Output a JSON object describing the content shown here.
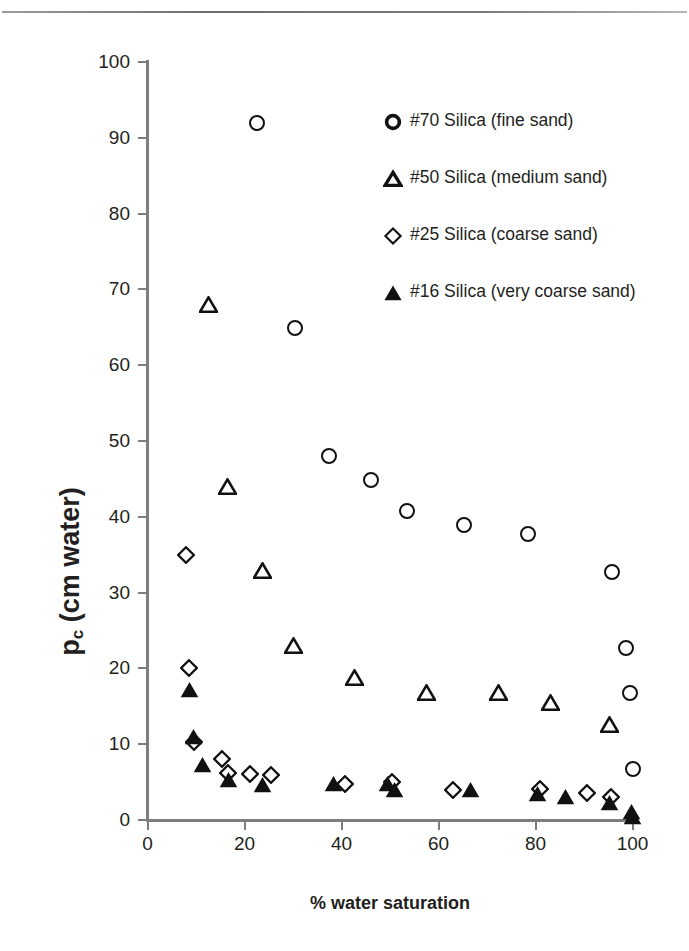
{
  "figure": {
    "x_axis_title": "% water saturation",
    "y_axis_title_main": "p",
    "y_axis_title_sub": "c",
    "y_axis_title_rest": " (cm water)"
  },
  "legend": {
    "items": [
      {
        "label": "#70 Silica  (fine sand)",
        "marker": "circle-open",
        "series": "#70"
      },
      {
        "label": "#50 Silica  (medium sand)",
        "marker": "triangle-open",
        "series": "#50"
      },
      {
        "label": "#25 Silica  (coarse sand)",
        "marker": "diamond-open",
        "series": "#25"
      },
      {
        "label": "#16 Silica  (very coarse sand)",
        "marker": "triangle-filled",
        "series": "#16"
      }
    ]
  },
  "chart_data": {
    "type": "scatter",
    "title": "",
    "xlabel": "% water saturation",
    "ylabel": "p_c (cm water)",
    "xlim": [
      0,
      100
    ],
    "ylim": [
      0,
      100
    ],
    "xticks": [
      0,
      20,
      40,
      60,
      80,
      100
    ],
    "yticks": [
      0,
      10,
      20,
      30,
      40,
      50,
      60,
      70,
      80,
      90,
      100
    ],
    "grid": false,
    "legend_position": "upper-right-inside",
    "series": [
      {
        "name": "#70 Silica  (fine sand)",
        "marker": "circle-open",
        "color": "#111111",
        "points": [
          [
            22.5,
            92.0
          ],
          [
            30.5,
            64.9
          ],
          [
            37.4,
            48.0
          ],
          [
            46.1,
            44.8
          ],
          [
            53.6,
            40.8
          ],
          [
            65.2,
            38.9
          ],
          [
            78.4,
            37.7
          ],
          [
            95.8,
            32.7
          ],
          [
            98.7,
            22.7
          ],
          [
            99.5,
            16.7
          ],
          [
            100.0,
            6.7
          ]
        ]
      },
      {
        "name": "#50 Silica  (medium sand)",
        "marker": "triangle-open",
        "color": "#111111",
        "points": [
          [
            12.6,
            67.9
          ],
          [
            16.5,
            43.9
          ],
          [
            23.7,
            32.9
          ],
          [
            30.1,
            23.0
          ],
          [
            42.7,
            18.7
          ],
          [
            57.5,
            16.8
          ],
          [
            72.4,
            16.7
          ],
          [
            83.0,
            15.5
          ],
          [
            95.2,
            12.5
          ]
        ]
      },
      {
        "name": "#25 Silica  (coarse sand)",
        "marker": "diamond-open",
        "color": "#111111",
        "points": [
          [
            7.9,
            35.0
          ],
          [
            8.6,
            20.1
          ],
          [
            9.6,
            10.3
          ],
          [
            15.3,
            8.0
          ],
          [
            16.6,
            6.2
          ],
          [
            21.2,
            6.1
          ],
          [
            25.4,
            5.9
          ],
          [
            40.8,
            4.8
          ],
          [
            50.5,
            5.0
          ],
          [
            62.9,
            4.0
          ],
          [
            81.0,
            4.1
          ],
          [
            90.7,
            3.5
          ],
          [
            95.6,
            3.0
          ]
        ]
      },
      {
        "name": "#16 Silica  (very coarse sand)",
        "marker": "triangle-filled",
        "color": "#111111",
        "points": [
          [
            8.6,
            17.1
          ],
          [
            9.5,
            10.9
          ],
          [
            11.3,
            7.2
          ],
          [
            16.7,
            5.3
          ],
          [
            23.7,
            4.6
          ],
          [
            38.4,
            4.7
          ],
          [
            49.4,
            4.7
          ],
          [
            51.0,
            3.9
          ],
          [
            66.6,
            3.9
          ],
          [
            80.5,
            3.4
          ],
          [
            86.2,
            3.1
          ],
          [
            95.2,
            2.3
          ],
          [
            99.8,
            1.1
          ],
          [
            100.0,
            0.4
          ]
        ]
      }
    ]
  }
}
